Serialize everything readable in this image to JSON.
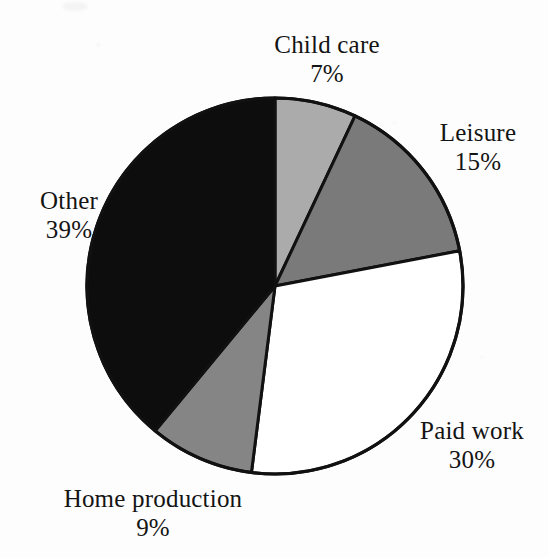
{
  "figure": {
    "background_color": "#fdfdfd",
    "outline_color": "#111111",
    "center_x": 275,
    "center_y": 286,
    "radius": 188,
    "start_angle_deg": 0,
    "direction": "clockwise"
  },
  "chart_data": {
    "type": "pie",
    "title": "",
    "subtitle": "",
    "xlabel": "",
    "ylabel": "",
    "legend_position": "none",
    "grid": false,
    "units": "percent",
    "total": 100,
    "categories": [
      "Child care",
      "Leisure",
      "Paid work",
      "Home production",
      "Other"
    ],
    "values": [
      7,
      15,
      30,
      9,
      39
    ],
    "value_labels": [
      "7%",
      "15%",
      "30%",
      "9%",
      "39%"
    ],
    "colors": [
      "#ababab",
      "#7a7a7a",
      "#ffffff",
      "#858585",
      "#0d0d0d"
    ],
    "slices": [
      {
        "label": "Child care",
        "value": 7,
        "value_label": "7%",
        "color": "#ababab",
        "start_angle_deg": 0.0,
        "end_angle_deg": 25.2,
        "label_position": "top"
      },
      {
        "label": "Leisure",
        "value": 15,
        "value_label": "15%",
        "color": "#7a7a7a",
        "start_angle_deg": 25.2,
        "end_angle_deg": 79.2,
        "label_position": "top-right"
      },
      {
        "label": "Paid work",
        "value": 30,
        "value_label": "30%",
        "color": "#ffffff",
        "start_angle_deg": 79.2,
        "end_angle_deg": 187.2,
        "label_position": "bottom-right"
      },
      {
        "label": "Home production",
        "value": 9,
        "value_label": "9%",
        "color": "#858585",
        "start_angle_deg": 187.2,
        "end_angle_deg": 219.6,
        "label_position": "bottom-left"
      },
      {
        "label": "Other",
        "value": 39,
        "value_label": "39%",
        "color": "#0d0d0d",
        "start_angle_deg": 219.6,
        "end_angle_deg": 360.0,
        "label_position": "left"
      }
    ]
  },
  "labels": {
    "child_care": {
      "name": "Child care",
      "value": "7%"
    },
    "leisure": {
      "name": "Leisure",
      "value": "15%"
    },
    "paid_work": {
      "name": "Paid work",
      "value": "30%"
    },
    "home_production": {
      "name": "Home production",
      "value": "9%"
    },
    "other": {
      "name": "Other",
      "value": "39%"
    }
  }
}
